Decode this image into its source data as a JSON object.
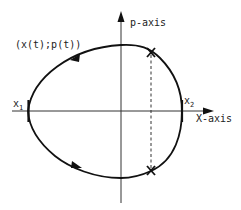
{
  "diagram": {
    "type": "phase-portrait",
    "axes": {
      "vertical_label": "p-axis",
      "horizontal_label": "X-axis"
    },
    "curve_label": "(x(t);p(t))",
    "points": {
      "x1": {
        "base": "x",
        "sub": "1"
      },
      "x2": {
        "base": "x",
        "sub": "2"
      }
    },
    "markers": [
      "X",
      "X"
    ],
    "colors": {
      "stroke": "#111111",
      "background": "#ffffff"
    }
  }
}
